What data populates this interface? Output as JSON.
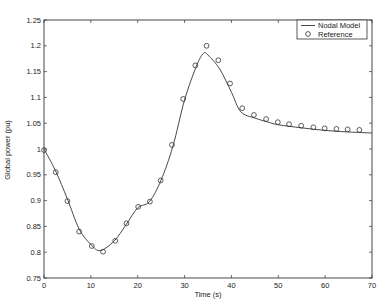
{
  "chart_data": {
    "type": "line",
    "title": "",
    "xlabel": "Time (s)",
    "ylabel": "Global power (pu)",
    "xlim": [
      0,
      70
    ],
    "ylim": [
      0.75,
      1.25
    ],
    "xticks": [
      0,
      10,
      20,
      30,
      40,
      50,
      60,
      70
    ],
    "xtick_labels": [
      "0",
      "10",
      "20",
      "30",
      "40",
      "50",
      "60",
      "70"
    ],
    "yticks": [
      0.75,
      0.8,
      0.85,
      0.9,
      0.95,
      1.0,
      1.05,
      1.1,
      1.15,
      1.2,
      1.25
    ],
    "ytick_labels": [
      "0.75",
      "0.8",
      "0.85",
      "0.9",
      "0.95",
      "1",
      "1.05",
      "1.1",
      "1.15",
      "1.2",
      "1.25"
    ],
    "grid": false,
    "legend_position": "upper right",
    "series": [
      {
        "name": "Nodal Model",
        "style": "solid-line",
        "x": [
          0,
          2.5,
          5,
          7.5,
          10,
          12,
          15,
          17.5,
          20,
          22.5,
          25,
          27.5,
          30,
          32.5,
          34,
          35,
          37.5,
          40,
          42,
          45,
          47.5,
          50,
          55,
          60,
          65,
          70
        ],
        "y": [
          1.0,
          0.957,
          0.903,
          0.845,
          0.815,
          0.803,
          0.822,
          0.853,
          0.886,
          0.898,
          0.94,
          1.005,
          1.095,
          1.16,
          1.185,
          1.182,
          1.155,
          1.11,
          1.072,
          1.06,
          1.053,
          1.047,
          1.041,
          1.036,
          1.033,
          1.031
        ]
      },
      {
        "name": "Reference",
        "style": "circle-marker",
        "x": [
          0,
          2.5,
          5,
          7.5,
          10.2,
          12.6,
          15.2,
          17.6,
          20.1,
          22.6,
          24.9,
          27.3,
          29.7,
          32.3,
          34.7,
          37.2,
          39.7,
          42.3,
          44.8,
          47.4,
          49.9,
          52.3,
          54.9,
          57.5,
          59.9,
          62.4,
          64.8,
          67.3
        ],
        "y": [
          0.998,
          0.955,
          0.899,
          0.84,
          0.812,
          0.801,
          0.822,
          0.856,
          0.888,
          0.898,
          0.939,
          1.008,
          1.097,
          1.162,
          1.2,
          1.172,
          1.127,
          1.079,
          1.066,
          1.058,
          1.052,
          1.048,
          1.045,
          1.042,
          1.04,
          1.039,
          1.038,
          1.037
        ]
      }
    ]
  },
  "legend": {
    "items": [
      {
        "label": "Nodal Model",
        "symbol": "line"
      },
      {
        "label": "Reference",
        "symbol": "circle"
      }
    ]
  },
  "colors": {
    "line": "#333333",
    "axis": "#333333",
    "background": "#ffffff"
  }
}
